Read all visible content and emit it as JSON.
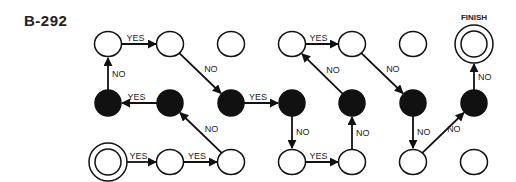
{
  "title": "B-292",
  "finish_label": "FINISH",
  "colors": {
    "stroke": "#111111",
    "filled": "#111111",
    "empty": "#ffffff",
    "text": "#222222"
  },
  "columns_x": [
    108,
    170,
    231,
    292,
    352,
    413,
    474
  ],
  "rows_y": [
    44,
    103,
    162
  ],
  "nodes": [
    {
      "id": "r0c0",
      "col": 0,
      "row": 0,
      "type": "empty"
    },
    {
      "id": "r0c1",
      "col": 1,
      "row": 0,
      "type": "empty"
    },
    {
      "id": "r0c2",
      "col": 2,
      "row": 0,
      "type": "empty"
    },
    {
      "id": "r0c3",
      "col": 3,
      "row": 0,
      "type": "empty"
    },
    {
      "id": "r0c4",
      "col": 4,
      "row": 0,
      "type": "empty"
    },
    {
      "id": "r0c5",
      "col": 5,
      "row": 0,
      "type": "empty"
    },
    {
      "id": "r0c6",
      "col": 6,
      "row": 0,
      "type": "finish"
    },
    {
      "id": "r1c0",
      "col": 0,
      "row": 1,
      "type": "filled"
    },
    {
      "id": "r1c1",
      "col": 1,
      "row": 1,
      "type": "filled"
    },
    {
      "id": "r1c2",
      "col": 2,
      "row": 1,
      "type": "filled"
    },
    {
      "id": "r1c3",
      "col": 3,
      "row": 1,
      "type": "filled"
    },
    {
      "id": "r1c4",
      "col": 4,
      "row": 1,
      "type": "filled"
    },
    {
      "id": "r1c5",
      "col": 5,
      "row": 1,
      "type": "filled"
    },
    {
      "id": "r1c6",
      "col": 6,
      "row": 1,
      "type": "filled"
    },
    {
      "id": "r2c0",
      "col": 0,
      "row": 2,
      "type": "start"
    },
    {
      "id": "r2c1",
      "col": 1,
      "row": 2,
      "type": "empty"
    },
    {
      "id": "r2c2",
      "col": 2,
      "row": 2,
      "type": "empty"
    },
    {
      "id": "r2c3",
      "col": 3,
      "row": 2,
      "type": "empty"
    },
    {
      "id": "r2c4",
      "col": 4,
      "row": 2,
      "type": "empty"
    },
    {
      "id": "r2c5",
      "col": 5,
      "row": 2,
      "type": "empty"
    },
    {
      "id": "r2c6",
      "col": 6,
      "row": 2,
      "type": "empty"
    }
  ],
  "edges": [
    {
      "from": "r2c0",
      "to": "r2c1",
      "label": "YES"
    },
    {
      "from": "r2c1",
      "to": "r2c2",
      "label": "YES"
    },
    {
      "from": "r2c2",
      "to": "r1c1",
      "label": "NO"
    },
    {
      "from": "r1c1",
      "to": "r1c0",
      "label": "YES"
    },
    {
      "from": "r1c0",
      "to": "r0c0",
      "label": "NO"
    },
    {
      "from": "r0c0",
      "to": "r0c1",
      "label": "YES"
    },
    {
      "from": "r0c1",
      "to": "r1c2",
      "label": "NO"
    },
    {
      "from": "r1c2",
      "to": "r1c3",
      "label": "YES"
    },
    {
      "from": "r1c3",
      "to": "r2c3",
      "label": "NO"
    },
    {
      "from": "r2c3",
      "to": "r2c4",
      "label": "YES"
    },
    {
      "from": "r2c4",
      "to": "r1c4",
      "label": "NO"
    },
    {
      "from": "r1c4",
      "to": "r0c3",
      "label": "NO"
    },
    {
      "from": "r0c3",
      "to": "r0c4",
      "label": "YES"
    },
    {
      "from": "r0c4",
      "to": "r1c5",
      "label": "NO"
    },
    {
      "from": "r1c5",
      "to": "r2c5",
      "label": "NO"
    },
    {
      "from": "r2c5",
      "to": "r1c6",
      "label": "NO"
    },
    {
      "from": "r1c6",
      "to": "r0c6",
      "label": "NO"
    }
  ]
}
